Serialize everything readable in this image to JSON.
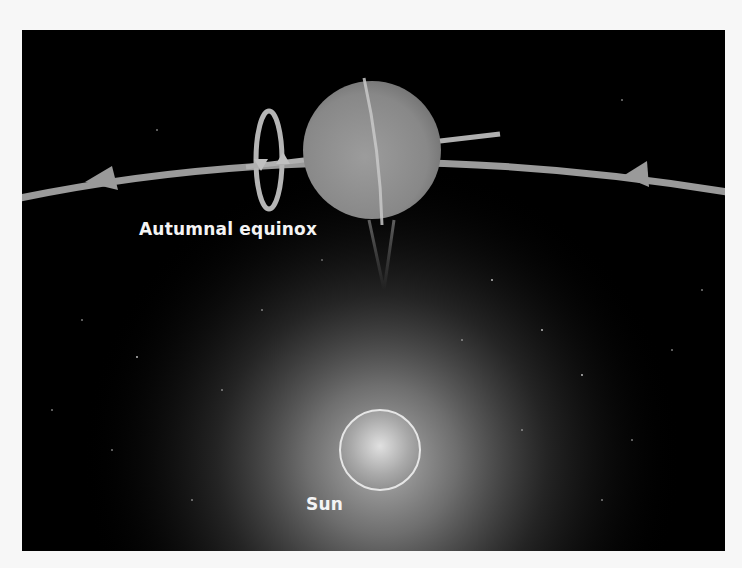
{
  "diagram": {
    "labels": {
      "planet_position": "Autumnal equinox",
      "star": "Sun"
    },
    "elements": {
      "planet": "planet-with-edge-on-rings",
      "rotation_indicator": "rotation-loop-with-arrows",
      "orbit": "orbit-path-with-direction-arrows",
      "star": "sun-with-glow"
    },
    "colors": {
      "background": "#000000",
      "orbit": "#9a9a9a",
      "planet": "#8a8a8a",
      "text": "#f4f4f4",
      "sun_glow": "#8c8c8c",
      "page": "#f7f7f7"
    }
  }
}
